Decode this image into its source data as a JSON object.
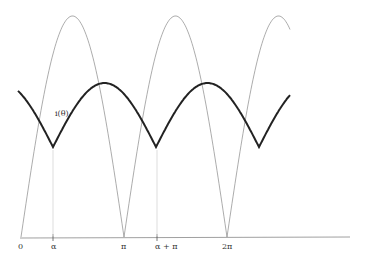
{
  "diagram": {
    "title": "",
    "curve_label": "i(θ)",
    "axis_labels": {
      "zero": "0",
      "alpha": "α",
      "pi": "π",
      "alpha_plus_pi": "α + π",
      "two_pi": "2π"
    },
    "series": [
      {
        "name": "rectified voltage |sin θ|",
        "style": "thin gray"
      },
      {
        "name": "current i(θ)",
        "style": "thick black"
      }
    ],
    "colors": {
      "thin": "#888888",
      "thick": "#222222",
      "axis": "#777777",
      "marker": "#cccccc"
    }
  }
}
